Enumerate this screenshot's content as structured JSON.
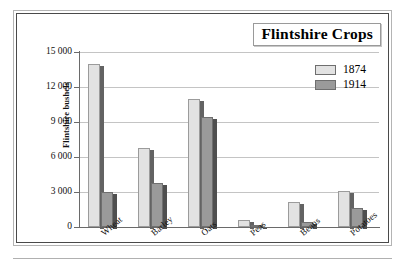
{
  "chart_data": {
    "type": "bar",
    "title": "Flintshire Crops",
    "xlabel": "",
    "ylabel": "Flintshire bushels",
    "ylim": [
      0,
      15000
    ],
    "yticks": [
      0,
      3000,
      6000,
      9000,
      12000,
      15000
    ],
    "ytick_labels": [
      "0",
      "3 000",
      "6 000",
      "9 000",
      "12 000",
      "15 000"
    ],
    "grid": true,
    "legend_position": "top-right",
    "categories": [
      "Wheat",
      "Barley",
      "Oats",
      "Peas",
      "Beans",
      "Potatoes"
    ],
    "series": [
      {
        "name": "1874",
        "color": "#e2e2e2",
        "values": [
          14000,
          6800,
          11000,
          600,
          2150,
          3050
        ]
      },
      {
        "name": "1914",
        "color": "#9a9a9a",
        "values": [
          3000,
          3800,
          9400,
          80,
          400,
          1650
        ]
      }
    ]
  },
  "chart": {
    "title": "Flintshire Crops",
    "y_axis_title": "Flintshire bushels"
  },
  "legend": {
    "items": [
      {
        "label": "1874",
        "color": "#e2e2e2"
      },
      {
        "label": "1914",
        "color": "#9a9a9a"
      }
    ]
  }
}
